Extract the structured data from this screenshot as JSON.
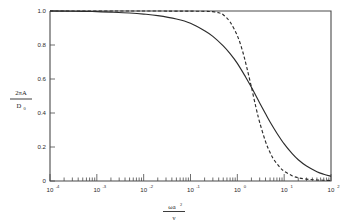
{
  "chart_data": {
    "type": "line",
    "title": "",
    "subtitle": "",
    "xlabel": "ωa²/ν",
    "xlabel_numerator": "ωa",
    "xlabel_numerator_exp": "2",
    "xlabel_denominator": "ν",
    "ylabel": "2πA / D₀",
    "ylabel_numerator": "2πA",
    "ylabel_denominator": "D",
    "ylabel_denominator_sub": "0",
    "xscale": "log",
    "yscale": "linear",
    "xlim": [
      0.0001,
      100
    ],
    "ylim": [
      0,
      1
    ],
    "grid": false,
    "legend": "none",
    "x_tick_labels": [
      "10⁻⁴",
      "10⁻³",
      "10⁻²",
      "10⁻¹",
      "10⁰",
      "10¹",
      "10²"
    ],
    "x_tick_mantissa": "10",
    "x_tick_exponents": [
      "-4",
      "-3",
      "-2",
      "-1",
      "0",
      "1",
      "2"
    ],
    "x_tick_values": [
      0.0001,
      0.001,
      0.01,
      0.1,
      1,
      10,
      100
    ],
    "y_tick_labels": [
      "1.0",
      "0.8",
      "0.6",
      "0.4",
      "0.2",
      "0"
    ],
    "y_tick_values": [
      1.0,
      0.8,
      0.6,
      0.4,
      0.2,
      0
    ],
    "series": [
      {
        "name": "solid-curve",
        "style": "solid",
        "color": "#2b2b2b",
        "x": [
          0.0001,
          0.0002,
          0.0005,
          0.001,
          0.002,
          0.005,
          0.01,
          0.02,
          0.05,
          0.1,
          0.2,
          0.3,
          0.5,
          0.7,
          1.0,
          1.5,
          2.0,
          3.0,
          4.0,
          5.0,
          7.0,
          10.0,
          15.0,
          20.0,
          30.0,
          50.0,
          70.0,
          100.0
        ],
        "y": [
          1.0,
          0.999,
          0.998,
          0.996,
          0.993,
          0.988,
          0.982,
          0.973,
          0.953,
          0.928,
          0.884,
          0.851,
          0.795,
          0.749,
          0.692,
          0.612,
          0.551,
          0.459,
          0.395,
          0.347,
          0.281,
          0.218,
          0.159,
          0.125,
          0.088,
          0.055,
          0.04,
          0.028
        ]
      },
      {
        "name": "dashed-curve",
        "style": "dashed",
        "color": "#2b2b2b",
        "x": [
          0.0001,
          0.01,
          0.1,
          0.2,
          0.3,
          0.4,
          0.5,
          0.7,
          1.0,
          1.3,
          1.6,
          2.0,
          2.5,
          3.0,
          4.0,
          5.0,
          6.0,
          8.0,
          10.0,
          15.0,
          20.0,
          30.0,
          50.0,
          100.0
        ],
        "y": [
          1.0,
          1.0,
          0.999,
          0.998,
          0.996,
          0.99,
          0.978,
          0.935,
          0.855,
          0.762,
          0.665,
          0.552,
          0.432,
          0.345,
          0.232,
          0.167,
          0.127,
          0.082,
          0.058,
          0.03,
          0.019,
          0.011,
          0.006,
          0.003
        ]
      }
    ],
    "annotations": [
      {
        "text": "curves cross near ωa²/ν ≈ 2.3, ordinate ≈ 0.27"
      }
    ]
  }
}
